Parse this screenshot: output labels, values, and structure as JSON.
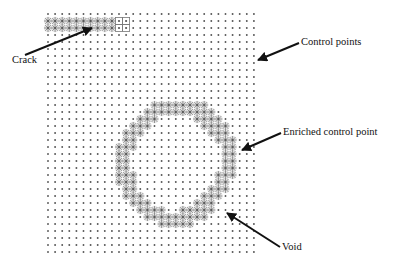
{
  "labels": {
    "crack": "Crack",
    "control_points": "Control points",
    "enriched_control_point": "Enriched control point",
    "void": "Void"
  },
  "colors": {
    "control_point": "#555555",
    "enriched": "#8a8a8a",
    "enriched_halo": "#cfcfcf",
    "arrow": "#111111",
    "box": "#777777"
  },
  "grid": {
    "columns": 30,
    "rows": 35
  },
  "crack": {
    "rows": [
      1,
      2
    ],
    "enriched_columns": [
      0,
      9
    ],
    "tip_box_columns": [
      10,
      11
    ]
  },
  "void_ring": [
    {
      "row": 13,
      "cols": [
        [
          15,
          22
        ]
      ]
    },
    {
      "row": 14,
      "cols": [
        [
          14,
          23
        ]
      ]
    },
    {
      "row": 15,
      "cols": [
        [
          13,
          15
        ],
        [
          21,
          24
        ]
      ]
    },
    {
      "row": 16,
      "cols": [
        [
          12,
          14
        ],
        [
          22,
          25
        ]
      ]
    },
    {
      "row": 17,
      "cols": [
        [
          11,
          13
        ],
        [
          23,
          25
        ]
      ]
    },
    {
      "row": 18,
      "cols": [
        [
          11,
          12
        ],
        [
          24,
          26
        ]
      ]
    },
    {
      "row": 19,
      "cols": [
        [
          10,
          12
        ],
        [
          25,
          26
        ]
      ]
    },
    {
      "row": 20,
      "cols": [
        [
          10,
          11
        ],
        [
          25,
          26
        ]
      ]
    },
    {
      "row": 21,
      "cols": [
        [
          10,
          11
        ],
        [
          25,
          26
        ]
      ]
    },
    {
      "row": 22,
      "cols": [
        [
          10,
          11
        ],
        [
          25,
          26
        ]
      ]
    },
    {
      "row": 23,
      "cols": [
        [
          10,
          12
        ],
        [
          24,
          26
        ]
      ]
    },
    {
      "row": 24,
      "cols": [
        [
          10,
          12
        ],
        [
          24,
          25
        ]
      ]
    },
    {
      "row": 25,
      "cols": [
        [
          11,
          12
        ],
        [
          23,
          25
        ]
      ]
    },
    {
      "row": 26,
      "cols": [
        [
          11,
          13
        ],
        [
          22,
          24
        ]
      ]
    },
    {
      "row": 27,
      "cols": [
        [
          12,
          14
        ],
        [
          21,
          23
        ]
      ]
    },
    {
      "row": 28,
      "cols": [
        [
          13,
          16
        ],
        [
          19,
          23
        ]
      ]
    },
    {
      "row": 29,
      "cols": [
        [
          14,
          22
        ]
      ]
    },
    {
      "row": 30,
      "cols": [
        [
          16,
          20
        ]
      ]
    }
  ]
}
